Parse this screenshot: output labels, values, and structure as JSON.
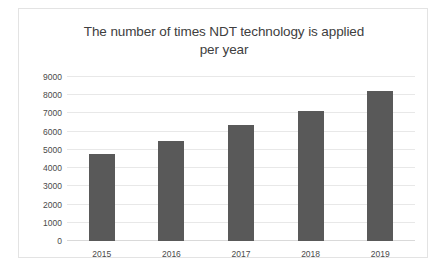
{
  "chart_data": {
    "type": "bar",
    "title": "The number of times NDT technology is applied per year",
    "title_line1": "The number of times NDT technology is applied",
    "title_line2": "per year",
    "categories": [
      "2015",
      "2016",
      "2017",
      "2018",
      "2019"
    ],
    "values": [
      4800,
      5500,
      6350,
      7150,
      8250
    ],
    "series": [
      {
        "name": "Number of times applied",
        "values": [
          4800,
          5500,
          6350,
          7150,
          8250
        ]
      }
    ],
    "xlabel": "",
    "ylabel": "",
    "ylim": [
      0,
      9000
    ],
    "ytick_step": 1000,
    "yticks": [
      "9000",
      "8000",
      "7000",
      "6000",
      "5000",
      "4000",
      "3000",
      "2000",
      "1000",
      "0"
    ],
    "ytick_values": [
      9000,
      8000,
      7000,
      6000,
      5000,
      4000,
      3000,
      2000,
      1000,
      0
    ],
    "grid": true,
    "legend": false,
    "legend_position": "none",
    "colors": {
      "bar": "#595959",
      "gridline": "#e8e8e8",
      "axis": "#d9d9d9",
      "text": "#404040",
      "tick_text": "#4a4a4a",
      "frame_border": "#e3e3e3",
      "background": "#ffffff"
    }
  }
}
